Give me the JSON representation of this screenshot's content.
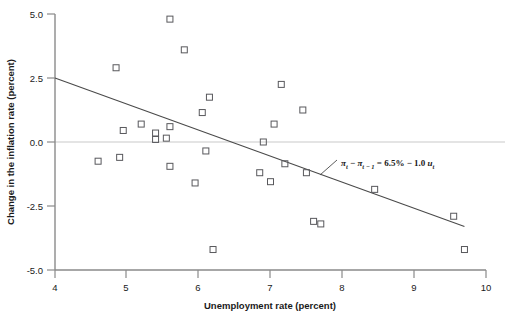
{
  "chart_data": {
    "type": "scatter",
    "title": "",
    "xlabel": "Unemployment rate (percent)",
    "ylabel": "Change in the inflation rate (percent)",
    "xlim": [
      4,
      10
    ],
    "ylim": [
      -5.0,
      5.0
    ],
    "xticks": [
      "4",
      "5",
      "6",
      "7",
      "8",
      "9",
      "10"
    ],
    "xtick_values": [
      4,
      5,
      6,
      7,
      8,
      9,
      10
    ],
    "yticks": [
      "5.0",
      "2.5",
      "0.0",
      "-2.5",
      "-5.0"
    ],
    "ytick_values": [
      5.0,
      2.5,
      0.0,
      -2.5,
      -5.0
    ],
    "grid": false,
    "legend": null,
    "marker_style": "open-square",
    "zero_line": 0.0,
    "points": [
      {
        "x": 4.6,
        "y": -0.75
      },
      {
        "x": 4.85,
        "y": 2.9
      },
      {
        "x": 4.9,
        "y": -0.6
      },
      {
        "x": 4.95,
        "y": 0.45
      },
      {
        "x": 5.2,
        "y": 0.7
      },
      {
        "x": 5.4,
        "y": 0.35
      },
      {
        "x": 5.4,
        "y": 0.1
      },
      {
        "x": 5.55,
        "y": 0.15
      },
      {
        "x": 5.6,
        "y": 0.6
      },
      {
        "x": 5.6,
        "y": 4.8
      },
      {
        "x": 5.6,
        "y": -0.95
      },
      {
        "x": 5.8,
        "y": 3.6
      },
      {
        "x": 5.95,
        "y": -1.6
      },
      {
        "x": 6.05,
        "y": 1.15
      },
      {
        "x": 6.1,
        "y": -0.35
      },
      {
        "x": 6.15,
        "y": 1.75
      },
      {
        "x": 6.2,
        "y": -4.2
      },
      {
        "x": 6.85,
        "y": -1.2
      },
      {
        "x": 6.9,
        "y": 0.0
      },
      {
        "x": 7.0,
        "y": -1.55
      },
      {
        "x": 7.05,
        "y": 0.7
      },
      {
        "x": 7.15,
        "y": 2.25
      },
      {
        "x": 7.2,
        "y": -0.85
      },
      {
        "x": 7.45,
        "y": 1.25
      },
      {
        "x": 7.5,
        "y": -1.2
      },
      {
        "x": 7.6,
        "y": -3.1
      },
      {
        "x": 7.7,
        "y": -3.2
      },
      {
        "x": 8.45,
        "y": -1.85
      },
      {
        "x": 9.55,
        "y": -2.9
      },
      {
        "x": 9.7,
        "y": -4.2
      }
    ],
    "fit_line": {
      "label": "regression line",
      "intercept_percent": 6.5,
      "slope": -1.0,
      "x_start": 4.0,
      "y_start": 2.5,
      "x_end": 9.7,
      "y_end": -3.3
    },
    "annotation": {
      "equation_plain": "πt − πt−1 = 6.5% − 1.0 ut",
      "pi_symbol": "π",
      "sub_t": "t",
      "sub_t_minus_1": "t − 1",
      "minus": "−",
      "equals": "=",
      "constant": "6.5%",
      "coefficient": "1.0",
      "u_symbol": "u"
    },
    "colors": {
      "marker_stroke": "#58585c",
      "axis": "#8a8a8a",
      "zero_line": "#c9c9c9",
      "fit_line": "#4a4a4a",
      "text": "#1a1a1a",
      "background": "#ffffff"
    }
  }
}
